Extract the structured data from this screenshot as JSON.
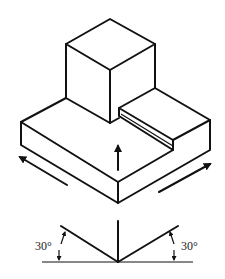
{
  "diagram": {
    "type": "isometric-projection",
    "object": "stepped block with cube on top",
    "labels": {
      "left_angle": "30°",
      "right_angle": "30°"
    },
    "arrows": {
      "up": "vertical axis",
      "left": "left isometric axis",
      "right": "right isometric axis"
    },
    "colors": {
      "line": "#111111",
      "background": "#ffffff"
    }
  }
}
